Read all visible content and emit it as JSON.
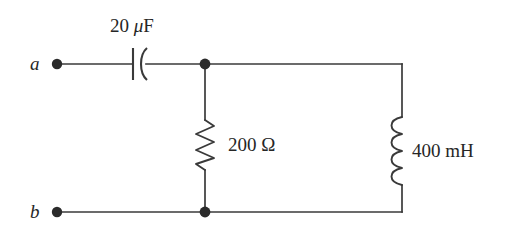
{
  "figure": {
    "type": "electrical-circuit-schematic",
    "background_color": "#ffffff",
    "line_color": "#3a3a3a",
    "text_color": "#262626"
  },
  "terminals": [
    {
      "id": "a",
      "label": "a",
      "x": 57,
      "y": 64
    },
    {
      "id": "b",
      "label": "b",
      "x": 57,
      "y": 212
    }
  ],
  "components": [
    {
      "id": "capacitor",
      "symbol": "capacitor-icon",
      "value": "20",
      "unit_prefix": "μ",
      "unit": "F",
      "label": "20 μF",
      "orientation": "horizontal",
      "x": 138,
      "y": 64
    },
    {
      "id": "resistor",
      "symbol": "resistor-icon",
      "value": "200",
      "unit": "Ω",
      "label": "200 Ω",
      "orientation": "vertical",
      "x": 205,
      "y": 145
    },
    {
      "id": "inductor",
      "symbol": "inductor-icon",
      "value": "400",
      "unit": "mH",
      "label": "400 mH",
      "orientation": "vertical",
      "x": 402,
      "y": 151
    }
  ],
  "nodes": [
    {
      "id": "top-junction",
      "x": 205,
      "y": 64
    },
    {
      "id": "bottom-junction",
      "x": 205,
      "y": 212
    }
  ],
  "labels": {
    "terminal_a": "a",
    "terminal_b": "b",
    "capacitor_value": "20",
    "capacitor_unit_prefix": "μ",
    "capacitor_unit": "F",
    "resistor_label": "200 Ω",
    "inductor_label": "400 mH"
  }
}
